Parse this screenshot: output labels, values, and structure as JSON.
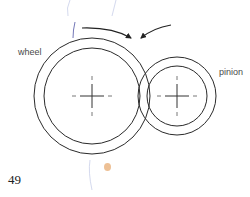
{
  "diagram": {
    "labels": {
      "wheel": "wheel",
      "pinion": "pinion"
    },
    "page_number": "49",
    "gears": [
      {
        "name": "wheel",
        "center": [
          92,
          96
        ],
        "outer_radius": 58,
        "inner_radius": 48
      },
      {
        "name": "pinion",
        "center": [
          177,
          96
        ],
        "outer_radius": 39,
        "inner_radius": 30
      }
    ],
    "arrows": [
      {
        "name": "wheel-rotation-arrow",
        "from": [
          82,
          28
        ],
        "to": [
          131,
          38
        ]
      },
      {
        "name": "pinion-rotation-arrow",
        "from": [
          171,
          25
        ],
        "to": [
          141,
          38
        ]
      }
    ],
    "colors": {
      "stroke": "#2a2a2a",
      "label": "#4a4a4a",
      "smudge": "#e8b07a"
    }
  }
}
